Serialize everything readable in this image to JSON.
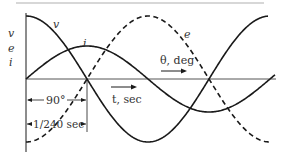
{
  "diagram": {
    "title": "",
    "axis_labels": {
      "vertical": [
        "v",
        "e",
        "i"
      ],
      "horizontal_time": "t, sec",
      "horizontal_angle": "θ, deg"
    },
    "curve_labels": {
      "v": "v",
      "i": "i",
      "e": "e"
    },
    "dimensions": {
      "phase": "90°",
      "time": "1/240 sec"
    },
    "colors": {
      "stroke": "#1a1a1a",
      "border": "#b0b0b0",
      "text": "#333333"
    }
  },
  "chart_data": {
    "type": "line",
    "title": "",
    "xlabel": "t, sec / θ, deg",
    "ylabel": "v, e, i",
    "series": [
      {
        "name": "v",
        "style": "solid",
        "shape": "cosine",
        "amplitude": 1.0
      },
      {
        "name": "i",
        "style": "solid",
        "shape": "sine",
        "amplitude": 0.52
      },
      {
        "name": "e",
        "style": "dashed",
        "shape": "negative cosine",
        "amplitude": 1.0
      }
    ],
    "annotations": [
      "90°",
      "1/240 sec"
    ]
  }
}
